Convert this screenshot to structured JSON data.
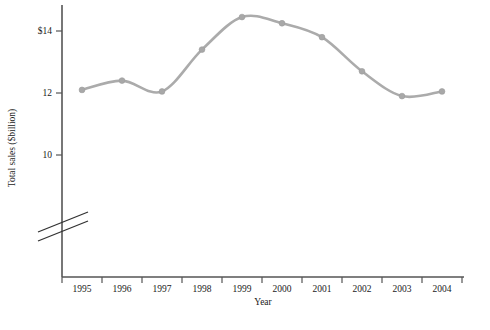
{
  "chart_data": {
    "type": "line",
    "title": "",
    "xlabel": "Year",
    "ylabel": "Total sales ($billion)",
    "categories": [
      "1995",
      "1996",
      "1997",
      "1998",
      "1999",
      "2000",
      "2001",
      "2002",
      "2003",
      "2004"
    ],
    "values": [
      12.1,
      12.4,
      12.05,
      13.4,
      14.45,
      14.25,
      13.8,
      12.7,
      11.9,
      12.05
    ],
    "series": [
      {
        "name": "Total sales",
        "values": [
          12.1,
          12.4,
          12.05,
          13.4,
          14.45,
          14.25,
          13.8,
          12.7,
          11.9,
          12.05
        ]
      }
    ],
    "ytick_labels": [
      "$14",
      "12",
      "10"
    ],
    "ytick_values": [
      14,
      12,
      10
    ],
    "ylim": [
      9.3,
      14.9
    ],
    "xlim": [
      0,
      10
    ],
    "grid": false,
    "legend": false,
    "axis_break": true,
    "line_color": "#ababab",
    "marker_color": "#a8a8a8",
    "axis_color": "#555555"
  },
  "axes": {
    "y_title": "Total sales ($billion)",
    "x_title": "Year"
  },
  "footer": {
    "caption": ""
  }
}
